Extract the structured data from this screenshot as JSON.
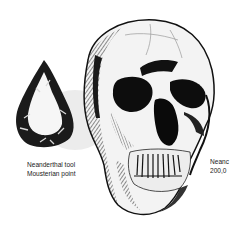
{
  "illustration": {
    "subject": "Neanderthal skull and Mousterian point tool engraving",
    "tool_caption": {
      "line1": "Neanderthal tool",
      "line2": "Mousterian point"
    },
    "skull_caption": {
      "line1": "Neanc",
      "line2": "200,0"
    },
    "colors": {
      "ink": "#111111",
      "paper": "#ffffff",
      "shade": "#d9d9d9"
    }
  }
}
